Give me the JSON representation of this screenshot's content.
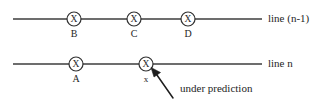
{
  "figure": {
    "colors": {
      "background": "#ffffff",
      "stroke": "#3c3c3c",
      "text": "#1e1e1e",
      "node_stroke": "#303030"
    }
  },
  "rows": [
    {
      "id": "row-n-minus-1",
      "label": "line (n-1)",
      "label_x": 268,
      "label_y": 22,
      "line": {
        "x1": 13,
        "y1": 19,
        "x2": 262,
        "y2": 19
      },
      "nodes": [
        {
          "name": "node-b",
          "glyph": "X",
          "label": "B",
          "cx": 74,
          "cy": 19,
          "r": 7,
          "label_y": 37,
          "label_size": "normal"
        },
        {
          "name": "node-c",
          "glyph": "X",
          "label": "C",
          "cx": 134,
          "cy": 19,
          "r": 7,
          "label_y": 37,
          "label_size": "normal"
        },
        {
          "name": "node-d",
          "glyph": "X",
          "label": "D",
          "cx": 188,
          "cy": 19,
          "r": 7,
          "label_y": 37,
          "label_size": "normal"
        }
      ]
    },
    {
      "id": "row-n",
      "label": "line n",
      "label_x": 268,
      "label_y": 67,
      "line": {
        "x1": 13,
        "y1": 64,
        "x2": 262,
        "y2": 64
      },
      "nodes": [
        {
          "name": "node-a",
          "glyph": "X",
          "label": "A",
          "cx": 76,
          "cy": 64,
          "r": 7,
          "label_y": 82,
          "label_size": "normal"
        },
        {
          "name": "node-x",
          "glyph": "X",
          "label": "x",
          "cx": 146,
          "cy": 64,
          "r": 7,
          "label_y": 82,
          "label_size": "small"
        }
      ]
    }
  ],
  "annotation": {
    "name": "under-prediction-annotation",
    "text": "under prediction",
    "text_x": 180,
    "text_y": 92,
    "arrow": {
      "from_x": 173,
      "from_y": 98,
      "to_x": 152,
      "to_y": 69,
      "head_size": 7
    }
  }
}
